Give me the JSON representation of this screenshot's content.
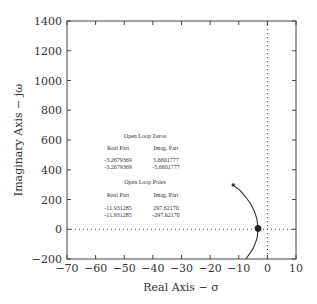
{
  "chart_data": {
    "type": "line",
    "title": "",
    "xlabel": "Real Axis − σ",
    "ylabel": "Imaginary Axis − jω",
    "xlim": [
      -70,
      10
    ],
    "ylim": [
      -200,
      1400
    ],
    "xticks": [
      -70,
      -60,
      -50,
      -40,
      -30,
      -20,
      -10,
      0,
      10
    ],
    "xtick_labels": [
      "−70",
      "−60",
      "−50",
      "−40",
      "−30",
      "−20",
      "−10",
      "0",
      "10"
    ],
    "yticks": [
      -200,
      0,
      200,
      400,
      600,
      800,
      1000,
      1200,
      1400
    ],
    "ytick_labels": [
      "−200",
      "0",
      "200",
      "400",
      "600",
      "800",
      "1000",
      "1200",
      "1400"
    ],
    "grid": false,
    "reference_lines": {
      "x0_dotted": true,
      "y0_dotted": true
    },
    "series": [
      {
        "name": "root locus branch",
        "x": [
          -11.93,
          -9.5,
          -7.5,
          -5.8,
          -4.5,
          -3.7,
          -3.3,
          -3.27,
          -3.6,
          -5.0,
          -7.5
        ],
        "y": [
          297.6,
          260,
          215,
          170,
          120,
          70,
          20,
          0,
          -60,
          -130,
          -200
        ]
      }
    ],
    "markers": [
      {
        "label": "open loop pole",
        "x": -11.93,
        "y": 297.6,
        "shape": "dot"
      },
      {
        "label": "open loop zero",
        "x": -3.27,
        "y": 5.66,
        "shape": "filled-circle"
      }
    ],
    "annotations": {
      "zeros_title": "Open Loop Zeros",
      "zeros_headers": [
        "Real Part",
        "Imag. Part"
      ],
      "zeros_rows": [
        [
          "-3.2679369",
          "5.6601777"
        ],
        [
          "-3.2679369",
          "-5.6601777"
        ]
      ],
      "poles_title": "Open Loop Poles",
      "poles_headers": [
        "Real Part",
        "Imag. Part"
      ],
      "poles_rows": [
        [
          "-11.931285",
          "297.62170"
        ],
        [
          "-11.931285",
          "-297.62170"
        ]
      ]
    }
  }
}
